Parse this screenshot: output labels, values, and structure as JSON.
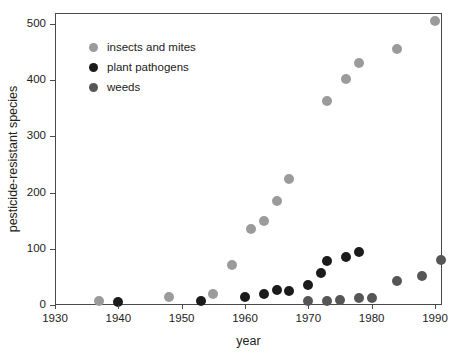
{
  "figure": {
    "xlabel": "year",
    "ylabel": "pesticide-resistant species"
  },
  "chart_data": {
    "type": "scatter",
    "title": "",
    "xlabel": "year",
    "ylabel": "pesticide-resistant species",
    "xlim": [
      1930,
      1992
    ],
    "ylim": [
      0,
      520
    ],
    "x_ticks": [
      1930,
      1940,
      1950,
      1960,
      1970,
      1980,
      1990
    ],
    "y_ticks": [
      0,
      100,
      200,
      300,
      400,
      500
    ],
    "grid": false,
    "legend_position": "upper-left-inside",
    "series": [
      {
        "name": "insects and mites",
        "color": "#9b9b9b",
        "points": [
          [
            1937,
            8
          ],
          [
            1948,
            15
          ],
          [
            1955,
            20
          ],
          [
            1958,
            72
          ],
          [
            1961,
            135
          ],
          [
            1963,
            150
          ],
          [
            1965,
            185
          ],
          [
            1967,
            225
          ],
          [
            1973,
            363
          ],
          [
            1976,
            403
          ],
          [
            1978,
            430
          ],
          [
            1984,
            455
          ],
          [
            1990,
            505
          ]
        ]
      },
      {
        "name": "plant pathogens",
        "color": "#1b1b1b",
        "points": [
          [
            1940,
            5
          ],
          [
            1953,
            8
          ],
          [
            1960,
            15
          ],
          [
            1963,
            20
          ],
          [
            1965,
            27
          ],
          [
            1967,
            25
          ],
          [
            1970,
            35
          ],
          [
            1972,
            57
          ],
          [
            1973,
            78
          ],
          [
            1976,
            86
          ],
          [
            1978,
            94
          ]
        ]
      },
      {
        "name": "weeds",
        "color": "#565656",
        "points": [
          [
            1970,
            7
          ],
          [
            1973,
            8
          ],
          [
            1975,
            9
          ],
          [
            1978,
            12
          ],
          [
            1980,
            12
          ],
          [
            1984,
            42
          ],
          [
            1988,
            52
          ],
          [
            1991,
            80
          ]
        ]
      }
    ]
  }
}
